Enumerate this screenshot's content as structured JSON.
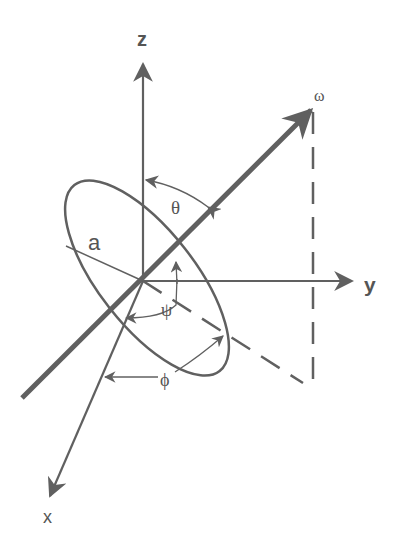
{
  "diagram": {
    "type": "3d-axes-rotation-geometry",
    "colors": {
      "line": "#606060",
      "label": "#555555",
      "background": "#ffffff"
    },
    "axes": {
      "z": {
        "label": "z"
      },
      "y": {
        "label": "y"
      },
      "x": {
        "label": "x"
      }
    },
    "vector": {
      "label": "ω"
    },
    "ellipse": {
      "label": "a"
    },
    "angles": {
      "theta": {
        "label": "θ"
      },
      "psi": {
        "label": "ψ"
      },
      "phi": {
        "label": "ϕ"
      }
    }
  }
}
